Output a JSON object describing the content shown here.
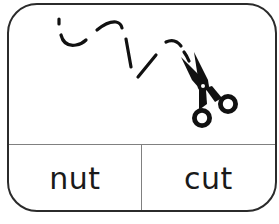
{
  "card": {
    "picture": {
      "description": "scissors cutting along a dashed line",
      "icons": [
        "scissors-icon",
        "dashed-cut-line"
      ]
    },
    "choices": [
      {
        "label": "nut"
      },
      {
        "label": "cut"
      }
    ]
  },
  "colors": {
    "border": "#2b2b2b",
    "divider": "#808080",
    "ink": "#111111",
    "background": "#ffffff"
  }
}
